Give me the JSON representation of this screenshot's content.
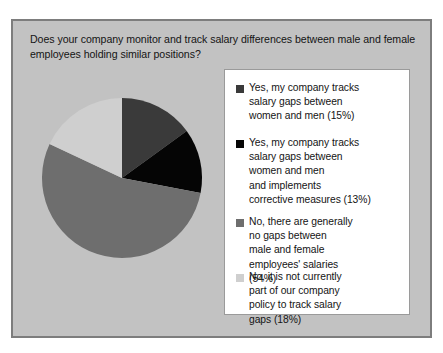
{
  "chart_data": {
    "type": "pie",
    "title": "Does your company monitor and track salary differences between male and female employees holding similar positions?",
    "categories": [
      "Yes, my company tracks salary gaps between women and men",
      "Yes, my company tracks salary gaps between women and men and implements corrective measures",
      "No, there are generally no gaps between male and female employees' salaries",
      "No, it is not currently part of our company policy to track salary gaps"
    ],
    "values": [
      15,
      13,
      54,
      18
    ],
    "value_suffix": "%",
    "colors": [
      "#3a3a3a",
      "#050505",
      "#6e6e6e",
      "#cfcfcf"
    ],
    "legend_position": "right",
    "start_angle_deg": 0,
    "direction": "clockwise",
    "xlabel": "",
    "ylabel": "",
    "grid": false
  },
  "legend": {
    "items": [
      {
        "label": "Yes, my company tracks\nsalary gaps between\nwomen and men (15%)",
        "swatch_color": "#3a3a3a",
        "swatch_name": "legend-swatch-tracks-gaps"
      },
      {
        "label": "Yes, my company tracks\nsalary gaps between\nwomen and men\nand implements\ncorrective measures (13%)",
        "swatch_color": "#050505",
        "swatch_name": "legend-swatch-tracks-and-corrects"
      },
      {
        "label": "No, there are generally\nno gaps between\nmale and female\nemployees' salaries\n(54%)",
        "swatch_color": "#6e6e6e",
        "swatch_name": "legend-swatch-no-gaps"
      },
      {
        "label": "No, it is not currently\npart of our company\npolicy to track salary\ngaps (18%)",
        "swatch_color": "#cfcfcf",
        "swatch_name": "legend-swatch-not-policy"
      }
    ]
  },
  "style": {
    "panel_background": "#c2c2c2",
    "panel_border": "#7d7d7d",
    "legend_background": "#ffffff",
    "legend_border": "#9a9a9a",
    "text_color": "#141414"
  }
}
